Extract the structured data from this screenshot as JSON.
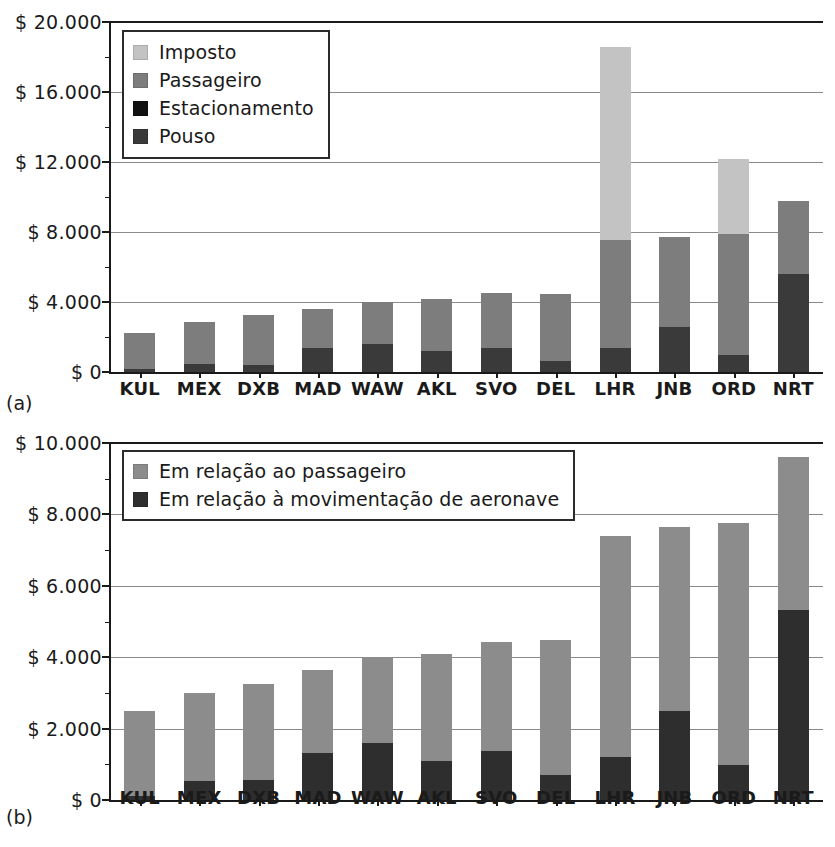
{
  "figure": {
    "panel_a_tag": "(a)",
    "panel_b_tag": "(b)"
  },
  "chart_data": [
    {
      "id": "a",
      "type": "bar",
      "stacked": true,
      "title": "",
      "xlabel": "",
      "ylabel": "",
      "ylim": [
        0,
        20000
      ],
      "ytick_values": [
        0,
        4000,
        8000,
        12000,
        16000,
        20000
      ],
      "ytick_labels": [
        "$ 0",
        "$ 4.000",
        "$ 8.000",
        "$ 12.000",
        "$ 16.000",
        "$ 20.000"
      ],
      "grid": true,
      "legend_position": "top-left",
      "categories": [
        "KUL",
        "MEX",
        "DXB",
        "MAD",
        "WAW",
        "AKL",
        "SVO",
        "DEL",
        "LHR",
        "JNB",
        "ORD",
        "NRT"
      ],
      "series": [
        {
          "name": "Pouso",
          "color": "#3a3a3a",
          "values": [
            150,
            480,
            400,
            1350,
            1600,
            1200,
            1400,
            650,
            1350,
            2600,
            950,
            5600
          ]
        },
        {
          "name": "Estacionamento",
          "color": "#111111",
          "values": [
            0,
            0,
            0,
            0,
            0,
            0,
            0,
            0,
            0,
            0,
            0,
            0
          ]
        },
        {
          "name": "Passageiro",
          "color": "#7d7d7d",
          "values": [
            2100,
            2370,
            2850,
            2250,
            2400,
            2950,
            3100,
            3800,
            6200,
            5100,
            6950,
            4200
          ]
        },
        {
          "name": "Imposto",
          "color": "#c3c3c3",
          "values": [
            0,
            0,
            0,
            0,
            0,
            0,
            0,
            0,
            11050,
            0,
            4300,
            0
          ]
        }
      ],
      "totals": [
        2250,
        2850,
        3250,
        3600,
        4000,
        4150,
        4500,
        4450,
        18600,
        7700,
        12200,
        9800
      ]
    },
    {
      "id": "b",
      "type": "bar",
      "stacked": true,
      "title": "",
      "xlabel": "",
      "ylabel": "",
      "ylim": [
        0,
        10000
      ],
      "ytick_values": [
        0,
        2000,
        4000,
        6000,
        8000,
        10000
      ],
      "ytick_labels": [
        "$ 0",
        "$ 2.000",
        "$ 4.000",
        "$ 6.000",
        "$ 8.000",
        "$ 10.000"
      ],
      "grid": true,
      "legend_position": "top-left",
      "categories": [
        "KUL",
        "MEX",
        "DXB",
        "MAD",
        "WAW",
        "AKL",
        "SVO",
        "DEL",
        "LHR",
        "JNB",
        "ORD",
        "NRT"
      ],
      "series": [
        {
          "name": "Em relação à movimentação de aeronave",
          "color": "#2e2e2e",
          "values": [
            120,
            520,
            550,
            1330,
            1600,
            1100,
            1380,
            700,
            1200,
            2480,
            980,
            5330
          ]
        },
        {
          "name": "Em relação ao passageiro",
          "color": "#8c8c8c",
          "values": [
            2380,
            2480,
            2700,
            2320,
            2400,
            3000,
            3050,
            3780,
            6200,
            5180,
            6780,
            4270
          ]
        }
      ],
      "totals": [
        2500,
        3000,
        3250,
        3650,
        4000,
        4100,
        4430,
        4480,
        7400,
        7660,
        7760,
        9600
      ]
    }
  ],
  "legend_a": {
    "items": [
      {
        "label": "Imposto",
        "color": "#c3c3c3"
      },
      {
        "label": "Passageiro",
        "color": "#7d7d7d"
      },
      {
        "label": "Estacionamento",
        "color": "#111111"
      },
      {
        "label": "Pouso",
        "color": "#3a3a3a"
      }
    ]
  },
  "legend_b": {
    "items": [
      {
        "label": "Em relação ao passageiro",
        "color": "#8c8c8c"
      },
      {
        "label": "Em relação à movimentação de aeronave",
        "color": "#2e2e2e"
      }
    ]
  }
}
